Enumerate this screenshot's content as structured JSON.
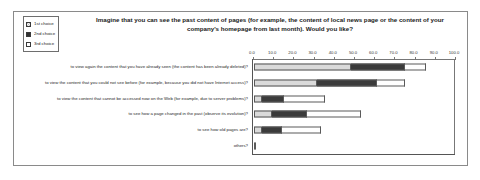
{
  "chart_data": {
    "type": "bar",
    "orientation": "horizontal",
    "stacked": true,
    "title": "Imagine that you can see the past content of pages (for example, the content of local news page or the content of your company's homepage from last month). Would you like?",
    "xlabel": "",
    "ylabel": "",
    "xlim": [
      0,
      100
    ],
    "grid": false,
    "legend_position": "top-left",
    "tick_labels": [
      "0.0",
      "10.0",
      "20.0",
      "30.0",
      "40.0",
      "50.0",
      "60.0",
      "70.0",
      "80.0",
      "90.0",
      "100.0"
    ],
    "tick_values": [
      0,
      10,
      20,
      30,
      40,
      50,
      60,
      70,
      80,
      90,
      100
    ],
    "categories": [
      "to view again the content that you have already seen (the content has been already deleted)?",
      "to view the content that you could not see before (for example, because you did not have Internet access)?",
      "to view the content that cannot be accessed now on the Web (for example, due to server problems)?",
      "to see how a page changed in the past (observe its evolution)?",
      "to see how old pages are?",
      "others?"
    ],
    "series": [
      {
        "name": "1st choice",
        "color": "#c6c6c6",
        "values": [
          48,
          31,
          4,
          9,
          4,
          1
        ]
      },
      {
        "name": "2nd choice",
        "color": "#3b3b3b",
        "values": [
          27,
          30,
          11,
          17,
          10,
          0
        ]
      },
      {
        "name": "3rd choice",
        "color": "#ffffff",
        "values": [
          10,
          14,
          20,
          27,
          19,
          0
        ]
      }
    ]
  },
  "legend": {
    "items": [
      {
        "label": "1st choice"
      },
      {
        "label": "2nd choice"
      },
      {
        "label": "3rd choice"
      }
    ]
  }
}
